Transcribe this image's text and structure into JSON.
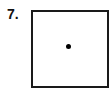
{
  "problem": {
    "number_label": "7.",
    "figure": {
      "shape": "square",
      "marker": "dot-at-center"
    }
  }
}
